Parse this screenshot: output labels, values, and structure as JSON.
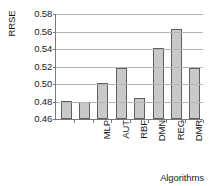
{
  "chart_data": {
    "type": "bar",
    "title": "",
    "categories": [
      "MLP",
      "AUT",
      "RBF",
      "DMN",
      "REG",
      "DMR",
      "PLS",
      "DTR"
    ],
    "values": [
      0.481,
      0.48,
      0.501,
      0.518,
      0.484,
      0.541,
      0.563,
      0.518
    ],
    "xlabel": "Algorithms",
    "ylabel": "RRSE",
    "ylim": [
      0.46,
      0.58
    ],
    "yticks": [
      "0.46",
      "0.48",
      "0.50",
      "0.52",
      "0.54",
      "0.56",
      "0.58"
    ],
    "ytick_values": [
      0.46,
      0.48,
      0.5,
      0.52,
      0.54,
      0.56,
      0.58
    ],
    "grid": true,
    "legend": false,
    "bar_color": "#c9c9c9",
    "bar_border_color": "#5e5e5e",
    "axis_color": "#7a7a7a",
    "gridline_color": "#b4b4b4"
  }
}
